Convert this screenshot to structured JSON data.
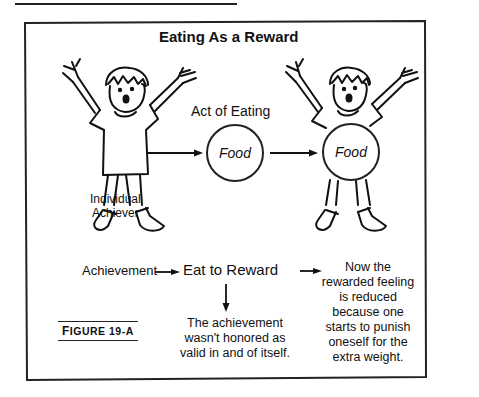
{
  "diagram": {
    "title": "Eating As a Reward",
    "act_label": "Act of Eating",
    "food_circle_1": "Food",
    "food_circle_2": "Food",
    "figure_label": "Individual Achiever",
    "figure_label_line1": "Individual",
    "figure_label_line2": "Achiever",
    "flow": {
      "step1": "Achievement",
      "step2": "Eat to Reward",
      "consequence_down_lines": [
        "The achievement",
        "wasn't honored as",
        "valid in and of itself."
      ],
      "consequence_right_lines": [
        "Now the",
        "rewarded feeling",
        "is reduced",
        "because one",
        "starts to punish",
        "oneself for the",
        "extra weight."
      ]
    },
    "caption": "Figure 19-A",
    "caption_first": "F",
    "caption_rest": "IGURE 19-A"
  }
}
